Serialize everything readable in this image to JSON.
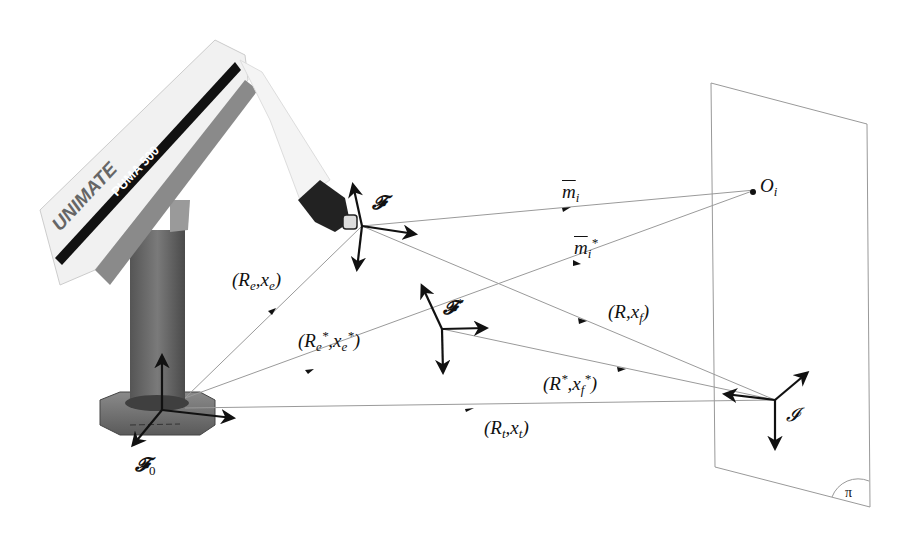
{
  "diagram": {
    "type": "robot visual servoing frames diagram",
    "robot": {
      "brand_label": "UNIMATE",
      "model_label": "PUMA 500"
    },
    "frames": {
      "base": {
        "symbol": "𝓕",
        "subscript": "0"
      },
      "end_effector": {
        "symbol": "𝓕"
      },
      "desired": {
        "symbol": "𝓕",
        "superscript": "*"
      },
      "image": {
        "symbol": "𝓘"
      }
    },
    "transforms": {
      "base_to_effector": {
        "open": "(",
        "R": "R",
        "R_sub": "e",
        "sep": ",",
        "x": "x",
        "x_sub": "e",
        "close": ")"
      },
      "base_to_desired": {
        "open": "(",
        "R": "R",
        "R_sub": "e",
        "R_sup": "*",
        "sep": ",",
        "x": "x",
        "x_sub": "e",
        "x_sup": "*",
        "close": ")"
      },
      "effector_to_image": {
        "open": "(",
        "R": "R",
        "sep": ",",
        "x": "x",
        "x_sub": "f",
        "close": ")"
      },
      "desired_to_image": {
        "open": "(",
        "R": "R",
        "R_sup": "*",
        "sep": ",",
        "x": "x",
        "x_sub": "f",
        "x_sup": "*",
        "close": ")"
      },
      "base_to_image": {
        "open": "(",
        "R": "R",
        "R_sub": "t",
        "sep": ",",
        "x": "x",
        "x_sub": "t",
        "close": ")"
      }
    },
    "rays": {
      "current": {
        "symbol": "m",
        "subscript": "i"
      },
      "desired": {
        "symbol": "m",
        "subscript": "i",
        "superscript": "*"
      }
    },
    "point": {
      "symbol": "O",
      "subscript": "i"
    },
    "plane": {
      "symbol": "π"
    }
  }
}
